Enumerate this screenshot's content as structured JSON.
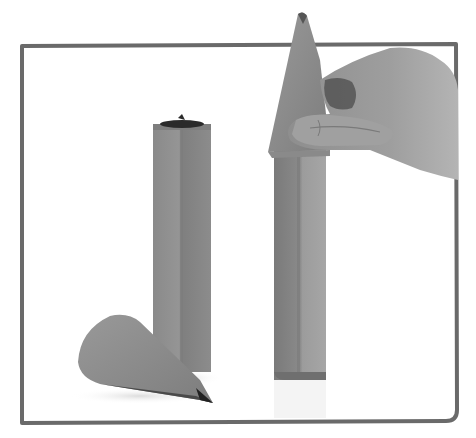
{
  "image": {
    "description": "Grayscale photograph of two paper pencil props inside a hand-drawn gray frame; a hand holds a paper cone tip atop the taller hexagonal tube on the right, a shorter tube stands on the left, and a loose paper cone lies on its side in the foreground.",
    "style": "grayscale photo",
    "colors": {
      "background": "#ffffff",
      "frame": "#6a6a6a",
      "paper": "#8e8e8e",
      "paper_dark": "#7a7a7a",
      "paper_light": "#a2a2a2",
      "tip": "#2a2a2a",
      "skin": "#9a9a9a",
      "skin_shadow": "#555555"
    },
    "objects": [
      {
        "name": "frame",
        "shape": "rounded rectangle outline",
        "x": 20,
        "y": 44,
        "width": 438,
        "height": 379
      },
      {
        "name": "short-tube",
        "shape": "hexagonal prism",
        "x": 153,
        "y": 122,
        "width": 58,
        "height": 250
      },
      {
        "name": "tall-tube",
        "shape": "hexagonal prism",
        "x": 274,
        "y": 148,
        "width": 52,
        "height": 232
      },
      {
        "name": "cone-on-tall-tube",
        "shape": "cone",
        "tip_x": 302,
        "tip_y": 12
      },
      {
        "name": "hand",
        "shape": "hand pinching cone"
      },
      {
        "name": "loose-cone",
        "shape": "cone lying on side",
        "tip_x": 213,
        "tip_y": 403
      }
    ]
  }
}
